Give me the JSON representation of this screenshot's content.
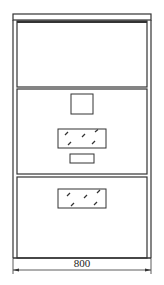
{
  "diagram": {
    "type": "cabinet-elevation",
    "stroke_color": "#333333",
    "panels": [
      {
        "name": "top-panel",
        "elements": []
      },
      {
        "name": "middle-panel",
        "elements": [
          "square-opening",
          "glass-window",
          "handle-slot"
        ]
      },
      {
        "name": "bottom-panel",
        "elements": [
          "glass-window"
        ]
      }
    ],
    "dimension": {
      "label": "800"
    }
  }
}
